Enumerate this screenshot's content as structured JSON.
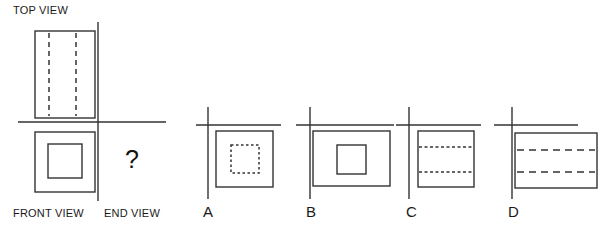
{
  "page": {
    "width": 610,
    "height": 233,
    "background": "#ffffff",
    "line_color": "#333333",
    "text_color": "#1a1a1a"
  },
  "problem": {
    "question_mark": "?",
    "labels": {
      "top_view": "TOP VIEW",
      "front_view": "FRONT VIEW",
      "end_view": "END VIEW"
    },
    "given_views": [
      {
        "name": "top-view",
        "shape": "rectangle",
        "orientation": "vertical",
        "hidden_lines": "two vertical dashed lines"
      },
      {
        "name": "front-view",
        "shape": "square",
        "inner": "smaller solid square centered",
        "hidden_lines": "none"
      }
    ]
  },
  "options": [
    {
      "letter": "A",
      "outer_shape": "square",
      "inner_shape": "dotted square",
      "hidden_lines": "dotted square outline centered"
    },
    {
      "letter": "B",
      "outer_shape": "wide rectangle",
      "inner_shape": "solid square",
      "hidden_lines": "none"
    },
    {
      "letter": "C",
      "outer_shape": "square",
      "inner_shape": "two horizontal dotted lines",
      "hidden_lines": "two horizontal dotted lines"
    },
    {
      "letter": "D",
      "outer_shape": "wide rectangle",
      "inner_shape": "two horizontal dashed lines",
      "hidden_lines": "two horizontal dashed lines"
    }
  ]
}
